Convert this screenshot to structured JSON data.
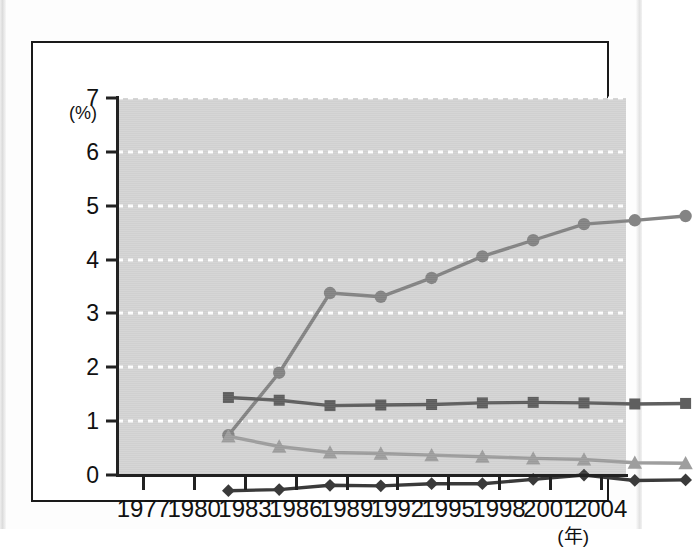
{
  "figure": {
    "y_axis_unit_label": "(%)",
    "x_axis_unit_label": "(年)"
  },
  "chart_data": {
    "type": "line",
    "title": "",
    "subtitle": "",
    "xlabel": "(年)",
    "ylabel": "(%)",
    "xlim": [
      1977,
      2004
    ],
    "ylim": [
      0,
      7
    ],
    "grid": true,
    "grid_color": "#ffffff",
    "grid_style": "dotted",
    "plot_background": "#d4d4d4",
    "legend": "none",
    "x_tick_labels": [
      "1977",
      "1980",
      "1983",
      "1986",
      "1989",
      "1992",
      "1995",
      "1998",
      "2001",
      "2004"
    ],
    "y_tick_labels": [
      "0",
      "1",
      "2",
      "3",
      "4",
      "5",
      "6",
      "7"
    ],
    "categories": [
      1977,
      1980,
      1983,
      1986,
      1989,
      1992,
      1995,
      1998,
      2001,
      2004
    ],
    "series": [
      {
        "name": "series-circle",
        "marker": "circle",
        "color": "#848484",
        "values": [
          1.76,
          2.92,
          4.4,
          4.33,
          4.68,
          5.08,
          5.38,
          5.68,
          5.75,
          5.83
        ]
      },
      {
        "name": "series-square",
        "marker": "square",
        "color": "#5f5f5f",
        "values": [
          2.46,
          2.41,
          2.31,
          2.32,
          2.33,
          2.36,
          2.37,
          2.36,
          2.34,
          2.35
        ]
      },
      {
        "name": "series-triangle",
        "marker": "triangle",
        "color": "#9e9e9e",
        "values": [
          1.74,
          1.55,
          1.44,
          1.42,
          1.39,
          1.36,
          1.33,
          1.31,
          1.25,
          1.24
        ]
      },
      {
        "name": "series-diamond",
        "marker": "diamond",
        "color": "#3a3a3a",
        "values": [
          0.73,
          0.75,
          0.83,
          0.82,
          0.86,
          0.86,
          0.94,
          1.02,
          0.92,
          0.93
        ]
      }
    ]
  }
}
